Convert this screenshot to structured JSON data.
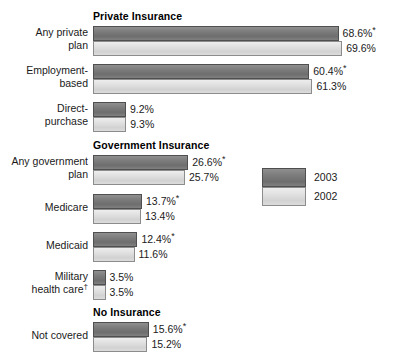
{
  "chart_data": {
    "type": "bar",
    "orientation": "horizontal",
    "title": "",
    "xlabel": "",
    "ylabel": "",
    "xlim": [
      0,
      72
    ],
    "grid": false,
    "legend_position": "right-middle",
    "value_suffix": "%",
    "significance_marker": "*",
    "footnote_marker": "†",
    "categories": [
      "Any private plan",
      "Employment-based",
      "Direct-purchase",
      "Any government plan",
      "Medicare",
      "Medicaid",
      "Military health care†",
      "Not covered"
    ],
    "series": [
      {
        "name": "2003",
        "color": "#7b7b7b",
        "values": [
          68.6,
          60.4,
          9.2,
          26.6,
          13.7,
          12.4,
          3.5,
          15.6
        ]
      },
      {
        "name": "2002",
        "color": "#e0e0e0",
        "values": [
          69.6,
          61.3,
          9.3,
          25.7,
          13.4,
          11.6,
          3.5,
          15.2
        ]
      }
    ],
    "sections": [
      {
        "header": "Private Insurance",
        "categories": [
          "Any private plan",
          "Employment-based",
          "Direct-purchase"
        ]
      },
      {
        "header": "Government Insurance",
        "categories": [
          "Any government plan",
          "Medicare",
          "Medicaid",
          "Military health care†"
        ]
      },
      {
        "header": "No Insurance",
        "categories": [
          "Not covered"
        ]
      }
    ]
  },
  "legend": {
    "items": [
      {
        "label": "2003",
        "color": "#7b7b7b"
      },
      {
        "label": "2002",
        "color": "#e0e0e0"
      }
    ]
  },
  "sections": {
    "private": {
      "header": "Private Insurance",
      "groups": [
        {
          "label_line1": "Any private",
          "label_line2": "plan",
          "bars": [
            {
              "year": "2003",
              "value": 68.6,
              "value_text": "68.6%",
              "starred": true,
              "star": "*"
            },
            {
              "year": "2002",
              "value": 69.6,
              "value_text": "69.6%",
              "starred": false,
              "star": ""
            }
          ]
        },
        {
          "label_line1": "Employment-",
          "label_line2": "based",
          "bars": [
            {
              "year": "2003",
              "value": 60.4,
              "value_text": "60.4%",
              "starred": true,
              "star": "*"
            },
            {
              "year": "2002",
              "value": 61.3,
              "value_text": "61.3%",
              "starred": false,
              "star": ""
            }
          ]
        },
        {
          "label_line1": "Direct-",
          "label_line2": "purchase",
          "bars": [
            {
              "year": "2003",
              "value": 9.2,
              "value_text": "9.2%",
              "starred": false,
              "star": ""
            },
            {
              "year": "2002",
              "value": 9.3,
              "value_text": "9.3%",
              "starred": false,
              "star": ""
            }
          ]
        }
      ]
    },
    "government": {
      "header": "Government Insurance",
      "groups": [
        {
          "label_line1": "Any government",
          "label_line2": "plan",
          "bars": [
            {
              "year": "2003",
              "value": 26.6,
              "value_text": "26.6%",
              "starred": true,
              "star": "*"
            },
            {
              "year": "2002",
              "value": 25.7,
              "value_text": "25.7%",
              "starred": false,
              "star": ""
            }
          ]
        },
        {
          "label_line1": "Medicare",
          "label_line2": "",
          "bars": [
            {
              "year": "2003",
              "value": 13.7,
              "value_text": "13.7%",
              "starred": true,
              "star": "*"
            },
            {
              "year": "2002",
              "value": 13.4,
              "value_text": "13.4%",
              "starred": false,
              "star": ""
            }
          ]
        },
        {
          "label_line1": "Medicaid",
          "label_line2": "",
          "bars": [
            {
              "year": "2003",
              "value": 12.4,
              "value_text": "12.4%",
              "starred": true,
              "star": "*"
            },
            {
              "year": "2002",
              "value": 11.6,
              "value_text": "11.6%",
              "starred": false,
              "star": ""
            }
          ]
        },
        {
          "label_line1": "Military",
          "label_line2": "health care",
          "label_line2_mark": "†",
          "bars": [
            {
              "year": "2003",
              "value": 3.5,
              "value_text": "3.5%",
              "starred": false,
              "star": ""
            },
            {
              "year": "2002",
              "value": 3.5,
              "value_text": "3.5%",
              "starred": false,
              "star": ""
            }
          ]
        }
      ]
    },
    "none": {
      "header": "No Insurance",
      "groups": [
        {
          "label_line1": "Not covered",
          "label_line2": "",
          "bars": [
            {
              "year": "2003",
              "value": 15.6,
              "value_text": "15.6%",
              "starred": true,
              "star": "*"
            },
            {
              "year": "2002",
              "value": 15.2,
              "value_text": "15.2%",
              "starred": false,
              "star": ""
            }
          ]
        }
      ]
    }
  },
  "layout": {
    "bar_origin_x": 93,
    "px_per_percent": 3.58,
    "bar_height": 15
  }
}
